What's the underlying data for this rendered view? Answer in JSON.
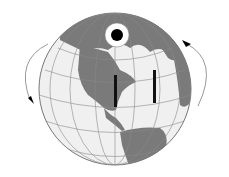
{
  "figure": {
    "colors": {
      "ocean": "#efefef",
      "land": "#7a7a7a",
      "grid": "#8a8a8a",
      "pole": "#000000",
      "bars": "#111111",
      "arrows": "#999999"
    },
    "elements": [
      "north-pole-marker",
      "left-bar",
      "right-bar",
      "left-rotation-arrow",
      "right-rotation-arrow"
    ]
  }
}
